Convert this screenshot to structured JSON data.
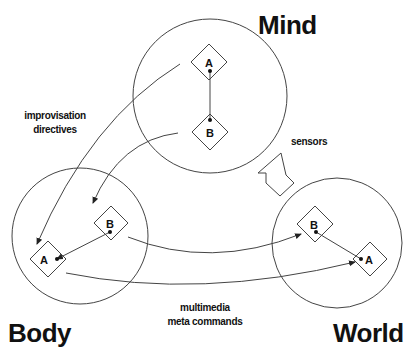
{
  "diagram": {
    "regions": [
      {
        "id": "mind",
        "label": "Mind",
        "nodes": [
          "A",
          "B"
        ]
      },
      {
        "id": "body",
        "label": "Body",
        "nodes": [
          "B",
          "A"
        ]
      },
      {
        "id": "world",
        "label": "World",
        "nodes": [
          "B",
          "A"
        ]
      }
    ],
    "labels": {
      "mind": "Mind",
      "body": "Body",
      "world": "World",
      "improvisation_line1": "improvisation",
      "improvisation_line2": "directives",
      "sensors": "sensors",
      "multimedia_line1": "multimedia",
      "multimedia_line2": "meta commands"
    },
    "nodes": {
      "mind_a": "A",
      "mind_b": "B",
      "body_a": "A",
      "body_b": "B",
      "world_a": "A",
      "world_b": "B"
    },
    "edges": [
      {
        "from": "mind.A",
        "to": "body.A",
        "label": "improvisation directives"
      },
      {
        "from": "mind.B",
        "to": "body.B"
      },
      {
        "from": "body.B",
        "to": "world.B",
        "label": "multimedia meta commands"
      },
      {
        "from": "body.A",
        "to": "world.A"
      },
      {
        "from": "world",
        "to": "mind",
        "label": "sensors"
      }
    ],
    "colors": {
      "stroke": "#333333",
      "text": "#111111",
      "background": "#ffffff"
    }
  }
}
